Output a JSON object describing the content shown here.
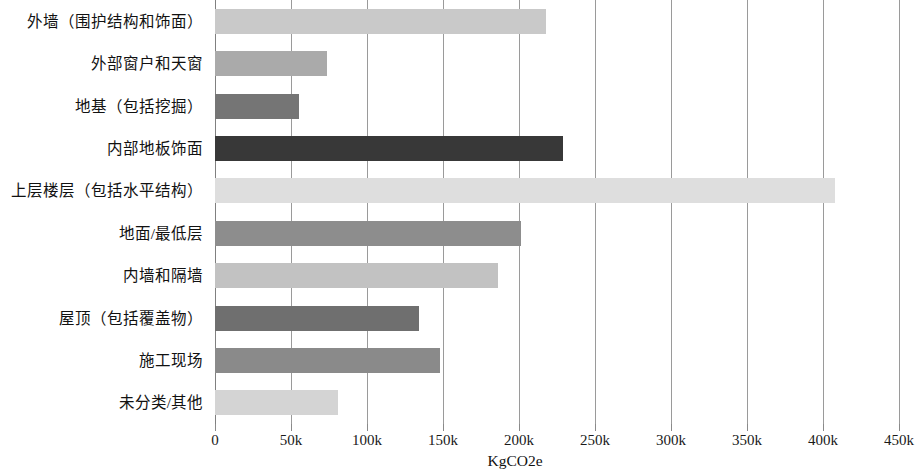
{
  "chart_data": {
    "type": "bar",
    "orientation": "horizontal",
    "title": "",
    "xlabel": "KgCO2e",
    "ylabel": "",
    "xlim": [
      0,
      450000
    ],
    "grid": true,
    "legend": "none",
    "xticks": [
      0,
      50000,
      100000,
      150000,
      200000,
      250000,
      300000,
      350000,
      400000,
      450000
    ],
    "xtick_labels": [
      "0",
      "50k",
      "100k",
      "150k",
      "200k",
      "250k",
      "300k",
      "350k",
      "400k",
      "450k"
    ],
    "categories": [
      "外墙（围护结构和饰面）",
      "外部窗户和天窗",
      "地基（包括挖掘）",
      "内部地板饰面",
      "上层楼层（包括水平结构）",
      "地面/最低层",
      "内墙和隔墙",
      "屋顶（包括覆盖物）",
      "施工现场",
      "未分类/其他"
    ],
    "values": [
      218000,
      74000,
      55000,
      229000,
      408000,
      201000,
      186000,
      134000,
      148000,
      81000
    ],
    "bar_colors": [
      "#c9c9c9",
      "#aaaaaa",
      "#757575",
      "#383838",
      "#dedede",
      "#8d8d8d",
      "#c2c2c2",
      "#6f6f6f",
      "#8a8a8a",
      "#d4d4d4"
    ]
  }
}
